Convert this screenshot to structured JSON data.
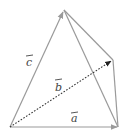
{
  "diagram": {
    "type": "tetrahedron-vectors",
    "vertices": {
      "origin": [
        10,
        127
      ],
      "a_end": [
        118,
        127
      ],
      "c_end": [
        64,
        10
      ],
      "b_end": [
        113,
        60
      ]
    },
    "vectors": [
      {
        "name": "a",
        "label": "a",
        "from": "origin",
        "to": "a_end",
        "style": "solid"
      },
      {
        "name": "b",
        "label": "b",
        "from": "origin",
        "to": "b_end",
        "style": "dotted"
      },
      {
        "name": "c",
        "label": "c",
        "from": "origin",
        "to": "c_end",
        "style": "solid"
      }
    ],
    "labels": {
      "a": "a",
      "b": "b",
      "c": "c"
    },
    "colors": {
      "edge": "#9a9a9a",
      "dotted_vector": "#333333",
      "label": "#444444",
      "background": "#ffffff"
    }
  }
}
